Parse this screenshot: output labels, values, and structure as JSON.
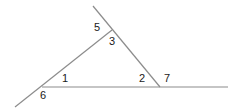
{
  "diagram": {
    "type": "triangle-with-extended-sides",
    "line_color": "#8c8c8c",
    "label_color": "#1a1a1a",
    "angle_labels": [
      {
        "id": "angle-5",
        "text": "5",
        "x": 94,
        "y": 22
      },
      {
        "id": "angle-3",
        "text": "3",
        "x": 109,
        "y": 36
      },
      {
        "id": "angle-1",
        "text": "1",
        "x": 62,
        "y": 73
      },
      {
        "id": "angle-2",
        "text": "2",
        "x": 139,
        "y": 73
      },
      {
        "id": "angle-7",
        "text": "7",
        "x": 164,
        "y": 73
      },
      {
        "id": "angle-6",
        "text": "6",
        "x": 40,
        "y": 90
      }
    ]
  }
}
